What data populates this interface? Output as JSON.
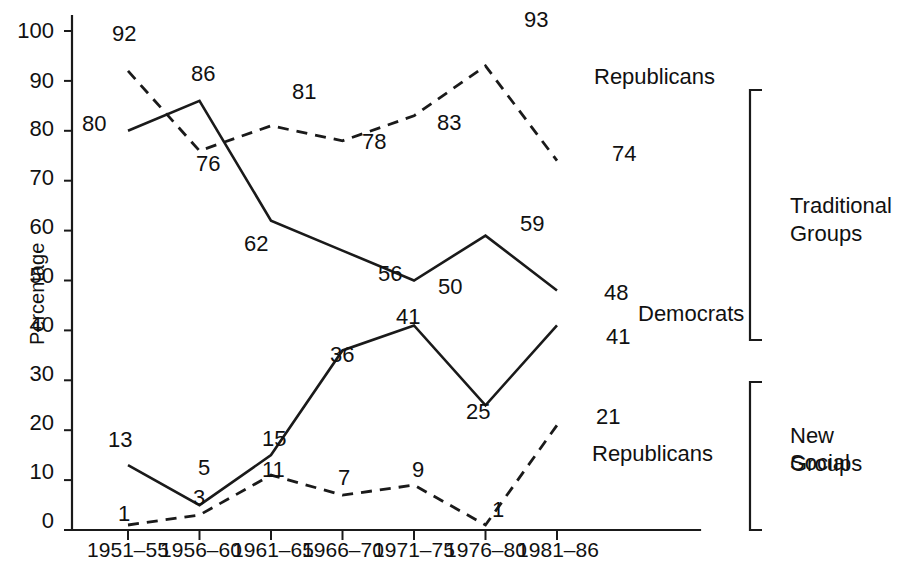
{
  "chart_data": {
    "type": "line",
    "title": "",
    "xlabel": "",
    "ylabel": "Percentage",
    "ylim": [
      0,
      100
    ],
    "ytick_labels": [
      "100",
      "90",
      "80",
      "70",
      "60",
      "50",
      "40",
      "30",
      "20",
      "10",
      "0"
    ],
    "yticks": [
      100,
      90,
      80,
      70,
      60,
      50,
      40,
      30,
      20,
      10,
      0
    ],
    "grid": false,
    "legend_position": "inline-right",
    "categories": [
      "1951–55",
      "1956–60",
      "1961–65",
      "1966–70",
      "1971–75",
      "1976–80",
      "1981–86"
    ],
    "series": [
      {
        "name": "Republicans",
        "group": "Traditional Groups",
        "style": "dashed",
        "values": [
          92,
          76,
          81,
          78,
          83,
          93,
          74
        ],
        "label_text": "Republicans"
      },
      {
        "name": "Democrats",
        "group": "Traditional Groups",
        "style": "solid",
        "values": [
          80,
          86,
          62,
          56,
          50,
          59,
          48
        ],
        "label_text": "Democrats"
      },
      {
        "name": "Democrats",
        "group": "New Social Groups",
        "style": "solid",
        "values": [
          13,
          5,
          15,
          36,
          41,
          25,
          41
        ],
        "label_text": ""
      },
      {
        "name": "Republicans",
        "group": "New Social Groups",
        "style": "dashed",
        "values": [
          1,
          3,
          11,
          7,
          9,
          1,
          21
        ],
        "label_text": "Republicans"
      }
    ],
    "groups": [
      {
        "name": "Traditional Groups",
        "label": "Traditional\nGroups"
      },
      {
        "name": "New Social Groups",
        "label": "New Social\nGroups"
      }
    ]
  },
  "axis": {
    "y_title": "Percentage"
  },
  "point_labels": {
    "trad_rep": [
      "92",
      "76",
      "81",
      "78",
      "83",
      "93",
      "74"
    ],
    "trad_dem": [
      "80",
      "86",
      "62",
      "56",
      "50",
      "59",
      "48"
    ],
    "new_dem": [
      "13",
      "5",
      "15",
      "36",
      "41",
      "25",
      "41"
    ],
    "new_rep": [
      "1",
      "3",
      "11",
      "7",
      "9",
      "1",
      "21"
    ]
  },
  "series_labels": {
    "trad_republicans": "Republicans",
    "trad_democrats": "Democrats",
    "new_republicans": "Republicans"
  },
  "group_labels": {
    "traditional_line1": "Traditional",
    "traditional_line2": "Groups",
    "new_social_line1": "New Social",
    "new_social_line2": "Groups"
  },
  "ytick_labels": {
    "t100": "100",
    "t90": "90",
    "t80": "80",
    "t70": "70",
    "t60": "60",
    "t50": "50",
    "t40": "40",
    "t30": "30",
    "t20": "20",
    "t10": "10",
    "t0": "0"
  },
  "xtick_labels": {
    "x0": "1951–55",
    "x1": "1956–60",
    "x2": "1961–65",
    "x3": "1966–70",
    "x4": "1971–75",
    "x5": "1976–80",
    "x6": "1981–86"
  },
  "colors": {
    "ink": "#1a1a1a",
    "background": "#ffffff"
  }
}
